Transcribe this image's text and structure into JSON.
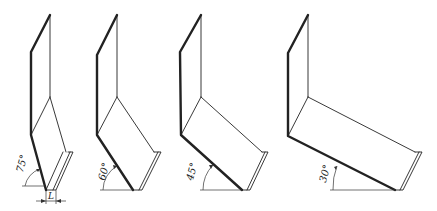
{
  "diagram": {
    "type": "technical-illustration",
    "panels": [
      {
        "id": "p1",
        "angle_label": "75°",
        "angle_deg": 75,
        "dimension_label": "L"
      },
      {
        "id": "p2",
        "angle_label": "60°",
        "angle_deg": 60
      },
      {
        "id": "p3",
        "angle_label": "45°",
        "angle_deg": 45
      },
      {
        "id": "p4",
        "angle_label": "30°",
        "angle_deg": 30
      }
    ],
    "colors": {
      "line": "#222222",
      "background": "#ffffff"
    }
  }
}
